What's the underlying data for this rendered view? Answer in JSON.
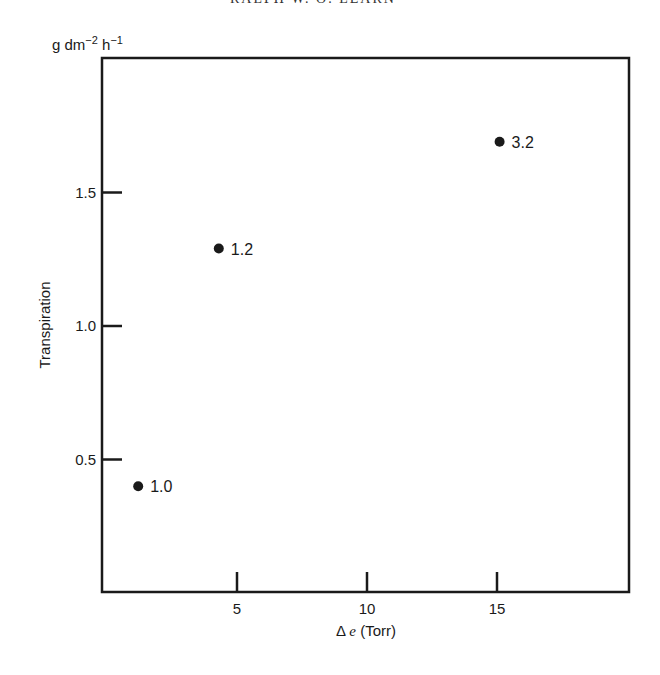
{
  "page": {
    "header_partial": "RALPH W. O. LEARN",
    "y_units": {
      "base": "g dm",
      "exp1": "−2",
      "mid": " h",
      "exp2": "−1"
    }
  },
  "chart_data": {
    "type": "scatter",
    "title": "",
    "xlabel": "Δe (Torr)",
    "xlabel_symbol": "Δ",
    "xlabel_var": "e",
    "xlabel_unit": "(Torr)",
    "ylabel": "Transpiration",
    "yunits": "g dm−2 h−1",
    "xlim": [
      0,
      20
    ],
    "ylim": [
      0,
      2.0
    ],
    "xticks": [
      5,
      10,
      15
    ],
    "yticks": [
      0.5,
      1.0,
      1.5
    ],
    "xtick_labels": [
      "5",
      "10",
      "15"
    ],
    "ytick_labels": [
      "0.5",
      "1.0",
      "1.5"
    ],
    "grid": false,
    "legend": null,
    "points": [
      {
        "x": 1.2,
        "y": 0.4,
        "label": "1.0"
      },
      {
        "x": 4.3,
        "y": 1.29,
        "label": "1.2"
      },
      {
        "x": 15.1,
        "y": 1.69,
        "label": "3.2"
      }
    ]
  }
}
